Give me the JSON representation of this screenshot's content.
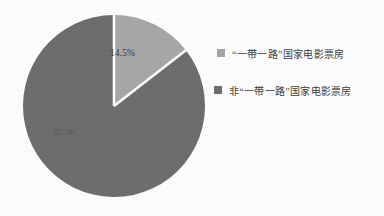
{
  "chart_data": {
    "type": "pie",
    "title": "",
    "subtitle": "",
    "xlabel": "",
    "ylabel": "",
    "legend_position": "right",
    "grid": false,
    "start_angle_deg": 0,
    "direction": "clockwise",
    "categories": [
      "“一带一路”国家电影票房",
      "非“一带一路”国家电影票房"
    ],
    "values": [
      14.5,
      85.5
    ],
    "value_labels": [
      "14.5%",
      "85.5%"
    ],
    "colors": [
      "#a8a8a8",
      "#6e6e6e"
    ],
    "slices": [
      {
        "name": "“一带一路”国家电影票房",
        "value": 14.5,
        "label": "14.5%",
        "color": "#a8a8a8"
      },
      {
        "name": "非“一带一路”国家电影票房",
        "value": 85.5,
        "label": "85.5%",
        "color": "#6e6e6e"
      }
    ]
  },
  "legend": {
    "items": [
      {
        "label": "“一带一路”国家电影票房",
        "color": "#a8a8a8"
      },
      {
        "label": "非“一带一路”国家电影票房",
        "color": "#6e6e6e"
      }
    ]
  },
  "colors": {
    "background": "#fefefe",
    "slice_light": "#a8a8a8",
    "slice_dark": "#6e6e6e",
    "separator": "#ffffff",
    "label_text": "#3a3a3a"
  }
}
